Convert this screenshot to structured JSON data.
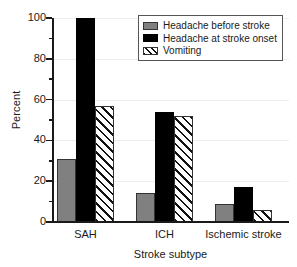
{
  "chart_data": {
    "type": "bar",
    "title": "",
    "xlabel": "Stroke subtype",
    "ylabel": "Percent",
    "ylim": [
      0,
      100
    ],
    "yticks": [
      0,
      20,
      40,
      60,
      80,
      100
    ],
    "ytick_labels": [
      "0",
      "20",
      "40",
      "60",
      "80",
      "100"
    ],
    "yminor_ticks": [
      10,
      30,
      50,
      70,
      90
    ],
    "grid": true,
    "legend_position": "upper right",
    "categories": [
      "SAH",
      "ICH",
      "Ischemic stroke"
    ],
    "series": [
      {
        "name": "Headache before stroke",
        "style": "solid-grey",
        "color": "#808080",
        "values": [
          31,
          14,
          9
        ]
      },
      {
        "name": "Headache at stroke onset",
        "style": "solid-black",
        "color": "#000000",
        "values": [
          100,
          54,
          17
        ]
      },
      {
        "name": "Vomiting",
        "style": "hatched-diagonal",
        "color": "#ffffff",
        "values": [
          57,
          52,
          6
        ]
      }
    ]
  },
  "legend": {
    "items": [
      {
        "label": "Headache before stroke",
        "swatch": "grey"
      },
      {
        "label": "Headache at stroke onset",
        "swatch": "black"
      },
      {
        "label": "Vomiting",
        "swatch": "hatch"
      }
    ]
  }
}
